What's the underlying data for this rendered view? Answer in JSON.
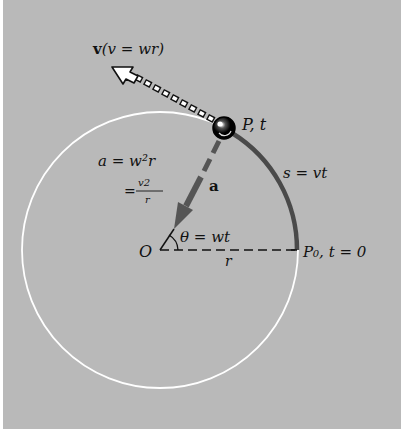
{
  "figure": {
    "background_color": "#b9b9b9",
    "circle_color": "#ffffff",
    "arc_color": "#4a4a4a",
    "accel_arrow_color": "#555555"
  },
  "labels": {
    "velocity": "v(v = wr)",
    "velocity_bold": "v",
    "velocity_rest": "(v = wr)",
    "point_p": "P, t",
    "arc_length": "s = vt",
    "accel_vector": "a",
    "accel_formula_line1": "a = w²r",
    "accel_formula_line2_eq": "=",
    "accel_formula_numerator": "v2",
    "accel_formula_denominator": "r",
    "angle": "θ = wt",
    "origin": "O",
    "radius": "r",
    "start_point": "P₀, t = 0"
  },
  "geometry": {
    "origin": [
      160,
      250
    ],
    "radius": 138,
    "angle_deg": 61
  }
}
